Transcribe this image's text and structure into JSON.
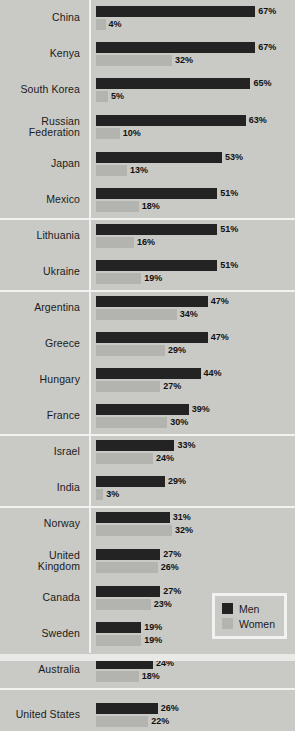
{
  "chart_data": {
    "type": "bar",
    "title": "",
    "xlabel": "",
    "ylabel": "",
    "orientation": "horizontal",
    "grid": false,
    "xlim": [
      0,
      70
    ],
    "value_suffix": "%",
    "legend_position": "bottom-right",
    "categories": [
      "China",
      "Kenya",
      "South Korea",
      "Russian\nFederation",
      "Japan",
      "Mexico",
      "Lithuania",
      "Ukraine",
      "Argentina",
      "Greece",
      "Hungary",
      "France",
      "Israel",
      "India",
      "Norway",
      "United\nKingdom",
      "Canada",
      "Sweden",
      "Australia",
      "United States"
    ],
    "series": [
      {
        "name": "Men",
        "color": "#232323",
        "values": [
          67,
          67,
          65,
          63,
          53,
          51,
          51,
          51,
          47,
          47,
          44,
          39,
          33,
          29,
          31,
          27,
          27,
          19,
          24,
          26
        ]
      },
      {
        "name": "Women",
        "color": "#b3b3b0",
        "values": [
          4,
          32,
          5,
          10,
          13,
          18,
          16,
          19,
          34,
          29,
          27,
          30,
          24,
          3,
          32,
          26,
          23,
          19,
          18,
          22
        ]
      }
    ],
    "rows": [
      {
        "label": "China",
        "men": 67,
        "men_label": "67%",
        "women": 4,
        "women_label": "4%",
        "group_start": false,
        "tall": false
      },
      {
        "label": "Kenya",
        "men": 67,
        "men_label": "67%",
        "women": 32,
        "women_label": "32%",
        "group_start": false,
        "tall": false
      },
      {
        "label": "South Korea",
        "men": 65,
        "men_label": "65%",
        "women": 5,
        "women_label": "5%",
        "group_start": false,
        "tall": false
      },
      {
        "label": "Russian\nFederation",
        "men": 63,
        "men_label": "63%",
        "women": 10,
        "women_label": "10%",
        "group_start": false,
        "tall": true
      },
      {
        "label": "Japan",
        "men": 53,
        "men_label": "53%",
        "women": 13,
        "women_label": "13%",
        "group_start": false,
        "tall": false
      },
      {
        "label": "Mexico",
        "men": 51,
        "men_label": "51%",
        "women": 18,
        "women_label": "18%",
        "group_start": false,
        "tall": false
      },
      {
        "label": "Lithuania",
        "men": 51,
        "men_label": "51%",
        "women": 16,
        "women_label": "16%",
        "group_start": true,
        "tall": false
      },
      {
        "label": "Ukraine",
        "men": 51,
        "men_label": "51%",
        "women": 19,
        "women_label": "19%",
        "group_start": false,
        "tall": false
      },
      {
        "label": "Argentina",
        "men": 47,
        "men_label": "47%",
        "women": 34,
        "women_label": "34%",
        "group_start": true,
        "tall": false
      },
      {
        "label": "Greece",
        "men": 47,
        "men_label": "47%",
        "women": 29,
        "women_label": "29%",
        "group_start": false,
        "tall": false
      },
      {
        "label": "Hungary",
        "men": 44,
        "men_label": "44%",
        "women": 27,
        "women_label": "27%",
        "group_start": false,
        "tall": false
      },
      {
        "label": "France",
        "men": 39,
        "men_label": "39%",
        "women": 30,
        "women_label": "30%",
        "group_start": false,
        "tall": false
      },
      {
        "label": "Israel",
        "men": 33,
        "men_label": "33%",
        "women": 24,
        "women_label": "24%",
        "group_start": true,
        "tall": false
      },
      {
        "label": "India",
        "men": 29,
        "men_label": "29%",
        "women": 3,
        "women_label": "3%",
        "group_start": false,
        "tall": false
      },
      {
        "label": "Norway",
        "men": 31,
        "men_label": "31%",
        "women": 32,
        "women_label": "32%",
        "group_start": true,
        "tall": false
      },
      {
        "label": "United\nKingdom",
        "men": 27,
        "men_label": "27%",
        "women": 26,
        "women_label": "26%",
        "group_start": false,
        "tall": true
      },
      {
        "label": "Canada",
        "men": 27,
        "men_label": "27%",
        "women": 23,
        "women_label": "23%",
        "group_start": false,
        "tall": false
      },
      {
        "label": "Sweden",
        "men": 19,
        "men_label": "19%",
        "women": 19,
        "women_label": "19%",
        "group_start": false,
        "tall": false
      },
      {
        "label": "Australia",
        "men": 24,
        "men_label": "24%",
        "women": 18,
        "women_label": "18%",
        "group_start": false,
        "tall": false
      },
      {
        "label": "United States",
        "men": 26,
        "men_label": "26%",
        "women": 22,
        "women_label": "22%",
        "group_start": true,
        "tall": false
      }
    ]
  },
  "legend": {
    "items": [
      {
        "label": "Men",
        "color": "#232323"
      },
      {
        "label": "Women",
        "color": "#b3b3b0"
      }
    ]
  },
  "colors": {
    "background": "#c9c9c6",
    "men": "#232323",
    "women": "#b3b3b0",
    "divider": "#f2f2f0",
    "text": "#1b1b1b"
  }
}
